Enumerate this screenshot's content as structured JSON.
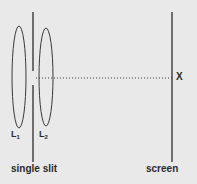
{
  "figure": {
    "background_color": "#e9e9e9",
    "stroke_color": "#3a3a3a",
    "labels": {
      "lens1": "L",
      "lens1_sub": "1",
      "lens2": "L",
      "lens2_sub": "2",
      "point_x": "X",
      "single_slit": "single slit",
      "screen": "screen"
    },
    "geometry": {
      "lens1_cx": 19,
      "lens1_cy": 77,
      "lens1_rx": 7,
      "lens1_ry": 51,
      "lens2_cx": 46,
      "lens2_cy": 77,
      "lens2_rx": 7,
      "lens2_ry": 49,
      "slit_x": 33,
      "slit_top_y1": 12,
      "slit_top_y2": 71,
      "slit_bottom_y1": 85,
      "slit_bottom_y2": 162,
      "screen_x": 172,
      "screen_y1": 12,
      "screen_y2": 162,
      "axis_y": 78,
      "axis_x1": 36,
      "axis_x2": 172
    }
  }
}
